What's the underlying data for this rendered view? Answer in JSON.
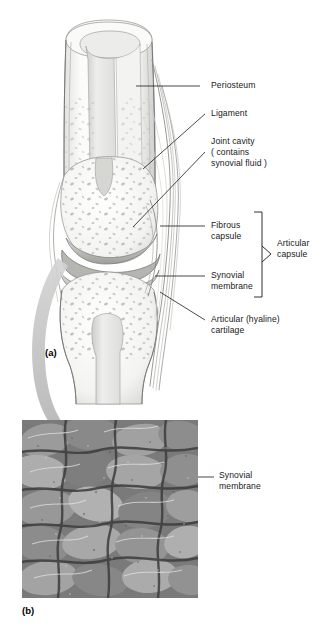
{
  "figure": {
    "title_panels": [
      {
        "id": "a",
        "letter": "(a)",
        "x": 45,
        "y": 352,
        "type": "illustration",
        "description": "Frontal section of a synovial joint"
      },
      {
        "id": "b",
        "letter": "(b)",
        "x": 22,
        "y": 610,
        "type": "micrograph",
        "description": "Scanning electron micrograph of synovial membrane"
      }
    ],
    "labels": [
      {
        "name": "periosteum",
        "lines": [
          "Periosteum"
        ],
        "x": 211,
        "y": 82,
        "leader": {
          "x1": 200,
          "y1": 86,
          "x2": 136,
          "y2": 86
        }
      },
      {
        "name": "ligament",
        "lines": [
          "Ligament"
        ],
        "x": 211,
        "y": 110,
        "leader": {
          "x1": 205,
          "y1": 114,
          "x2": 143,
          "y2": 169
        }
      },
      {
        "name": "joint-cavity",
        "lines": [
          "Joint cavity",
          "( contains",
          "synovial fluid )"
        ],
        "x": 211,
        "y": 138,
        "leader": {
          "x1": 205,
          "y1": 152,
          "x2": 133,
          "y2": 227
        }
      },
      {
        "name": "fibrous-capsule",
        "lines": [
          "Fibrous",
          "capsule"
        ],
        "x": 211,
        "y": 222,
        "leader": {
          "x1": 205,
          "y1": 226,
          "x2": 160,
          "y2": 226
        }
      },
      {
        "name": "synovial-membrane",
        "lines": [
          "Synovial",
          "membrane"
        ],
        "x": 211,
        "y": 272,
        "leader": {
          "x1": 205,
          "y1": 276,
          "x2": 155,
          "y2": 276
        }
      },
      {
        "name": "articular-cartilage",
        "lines": [
          "Articular (hyaline)",
          "cartilage"
        ],
        "x": 211,
        "y": 316,
        "leader": {
          "x1": 205,
          "y1": 320,
          "x2": 160,
          "y2": 292
        }
      },
      {
        "name": "synovial-membrane-micrograph",
        "lines": [
          "Synovial",
          "membrane"
        ],
        "x": 219,
        "y": 471,
        "leader": {
          "x1": 214,
          "y1": 477,
          "x2": 198,
          "y2": 477
        }
      }
    ],
    "bracket": {
      "name": "articular-capsule-bracket",
      "lines": [
        "Articular",
        "capsule"
      ],
      "text_x": 277,
      "text_y": 245,
      "x": 262,
      "y_top": 212,
      "y_bottom": 297,
      "tip_x": 271,
      "tip_y": 254
    },
    "micrograph": {
      "x": 22,
      "y": 420,
      "width": 176,
      "height": 178
    },
    "arrow": {
      "name": "magnification-arrow",
      "color": "#b9b9b9"
    },
    "colors": {
      "line": "#1a1a1a",
      "text": "#191919",
      "background": "#ffffff",
      "bone_light": "#f5f5f3",
      "bone_shade": "#d9d9d6",
      "cartilage": "#c9c9c7",
      "arrow_gray": "#bcbcbc"
    }
  }
}
